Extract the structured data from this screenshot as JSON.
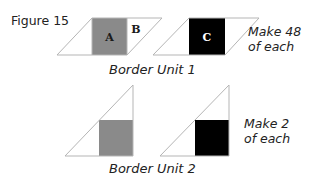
{
  "figure": {
    "title": "Figure 15"
  },
  "colors": {
    "gray_fill": "#8a8a8a",
    "black_fill": "#000000",
    "outline": "#b5b5b5",
    "text": "#222222",
    "letter_on_gray": "#1a1a1a",
    "letter_on_black": "#ffffff"
  },
  "border_unit_1": {
    "caption": "Border Unit 1",
    "note_line1": "Make 48",
    "note_line2": "of each",
    "shapes": [
      {
        "type": "parallelogram",
        "square_fill": "gray",
        "square_label": "A",
        "side_label": "B"
      },
      {
        "type": "parallelogram",
        "square_fill": "black",
        "square_label": "C"
      }
    ]
  },
  "border_unit_2": {
    "caption": "Border Unit 2",
    "note_line1": "Make 2",
    "note_line2": "of each",
    "shapes": [
      {
        "type": "right-triangle",
        "square_fill": "gray"
      },
      {
        "type": "right-triangle",
        "square_fill": "black"
      }
    ]
  }
}
